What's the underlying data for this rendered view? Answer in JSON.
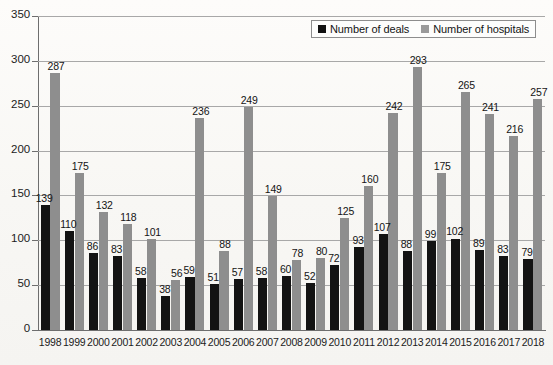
{
  "chart_data": {
    "type": "bar",
    "title": "",
    "xlabel": "",
    "ylabel": "",
    "ylim": [
      0,
      350
    ],
    "ytick_step": 50,
    "yticks": [
      0,
      50,
      100,
      150,
      200,
      250,
      300,
      350
    ],
    "grid": true,
    "legend_position": "top-right",
    "categories": [
      "1998",
      "1999",
      "2000",
      "2001",
      "2002",
      "2003",
      "2004",
      "2005",
      "2006",
      "2007",
      "2008",
      "2009",
      "2010",
      "2011",
      "2012",
      "2013",
      "2014",
      "2015",
      "2016",
      "2017",
      "2018"
    ],
    "series": [
      {
        "name": "Number of deals",
        "color": "#131313",
        "values": [
          139,
          110,
          86,
          83,
          58,
          38,
          59,
          51,
          57,
          58,
          60,
          52,
          72,
          93,
          107,
          88,
          99,
          102,
          89,
          83,
          79
        ]
      },
      {
        "name": "Number of hospitals",
        "color": "#8e8e8e",
        "values": [
          287,
          175,
          132,
          118,
          101,
          56,
          236,
          88,
          249,
          149,
          78,
          80,
          125,
          160,
          242,
          293,
          175,
          265,
          241,
          216,
          257
        ]
      }
    ]
  },
  "legend": {
    "items": [
      {
        "label": "Number of deals",
        "swatch": "deals"
      },
      {
        "label": "Number of hospitals",
        "swatch": "hospitals"
      }
    ]
  }
}
